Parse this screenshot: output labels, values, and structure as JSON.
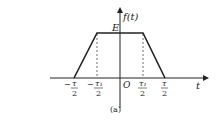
{
  "figure": {
    "y_axis_label": "f(t)",
    "x_axis_label": "t",
    "origin_label": "O",
    "amplitude_label": "E",
    "caption": "(a)",
    "ticks": [
      {
        "sign": "−",
        "num": "τ",
        "den": "2"
      },
      {
        "sign": "−",
        "num": "τ₁",
        "den": "2"
      },
      {
        "sign": "",
        "num": "τ₁",
        "den": "2"
      },
      {
        "sign": "",
        "num": "τ",
        "den": "2"
      }
    ]
  },
  "shape": {
    "type": "trapezoidal pulse",
    "points": [
      [
        -1,
        0
      ],
      [
        -0.5,
        1
      ],
      [
        0.5,
        1
      ],
      [
        1,
        0
      ]
    ],
    "line_color": "#222222"
  }
}
